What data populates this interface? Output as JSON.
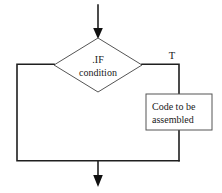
{
  "diagram": {
    "background_color": "#ffffff",
    "line_color": "#1f1f1f",
    "shape_outline_color": "#555555",
    "text_color": "#1a1a1a",
    "nodes": {
      "decision": {
        "shape": "diamond",
        "line1": ".IF",
        "line2": "condition",
        "center_x": 98,
        "center_y": 65,
        "half_width": 44,
        "half_height": 27
      },
      "process": {
        "shape": "rectangle",
        "line1": "Code to be",
        "line2": "assembled",
        "x": 146,
        "y": 94,
        "width": 66,
        "height": 36
      }
    },
    "labels": {
      "true_branch": "T"
    },
    "arrows": {
      "entry": "down-arrow-into-decision",
      "exit": "down-arrow-out-of-merge"
    }
  }
}
